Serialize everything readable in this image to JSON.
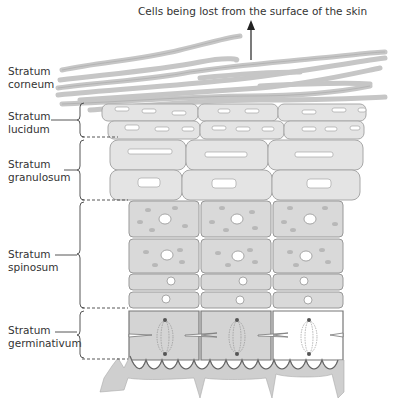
{
  "title": "Cells being lost from the surface of the skin",
  "layers": [
    {
      "line1": "Stratum",
      "line2": "corneum"
    },
    {
      "line1": "Stratum",
      "line2": "lucidum"
    },
    {
      "line1": "Stratum",
      "line2": "granulosum"
    },
    {
      "line1": "Stratum",
      "line2": "spinosum"
    },
    {
      "line1": "Stratum",
      "line2": "germinativum"
    }
  ],
  "colors": {
    "cell_fill": "#e4e4e4",
    "cell_stroke": "#a8a8a8",
    "deep_cell_fill": "#d4d4d4",
    "corneum_fiber": "#c8c8c8",
    "text": "#333333",
    "line": "#444444"
  },
  "icons": [
    "up-arrow-icon",
    "bracket-icon",
    "dashed-divider"
  ]
}
